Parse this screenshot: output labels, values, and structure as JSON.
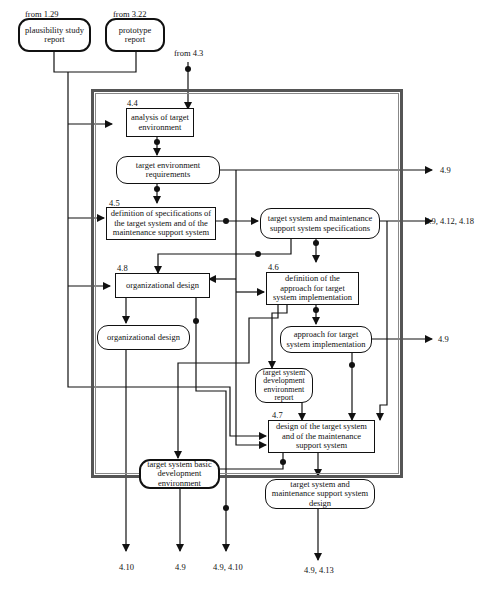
{
  "diagram": {
    "type": "process-flow",
    "frame_label": "",
    "external_inputs": {
      "plausibility": {
        "source": "from 1.29",
        "label": "plausibility study report"
      },
      "prototype": {
        "source": "from 3.22",
        "label": "prototype report"
      },
      "from43": {
        "source": "from 4.3"
      }
    },
    "processes": {
      "p44": {
        "id": "4.4",
        "label": "analysis of target environment"
      },
      "p45": {
        "id": "4.5",
        "label": "definition of specifications of the target system and of the maintenance support system"
      },
      "p48": {
        "id": "4.8",
        "label": "organizational design"
      },
      "p46": {
        "id": "4.6",
        "label": "definition of the approach for target system implementation"
      },
      "p47": {
        "id": "4.7",
        "label": "design of the target system and of the maintenance support system"
      }
    },
    "data_items": {
      "ter": {
        "label": "target environment requirements"
      },
      "tsms": {
        "label": "target system and maintenance support system specifications"
      },
      "od": {
        "label": "organizational design"
      },
      "atsi": {
        "label": "approach for target system implementation"
      },
      "tsder": {
        "label": "target system development environment report"
      },
      "tsbde": {
        "label": "target system basic development environment"
      },
      "tsmsd": {
        "label": "target system and maintenance support system design"
      }
    },
    "outputs": {
      "o_ter": "4.9",
      "o_tsms": "4.9, 4.12, 4.18",
      "o_atsi": "4.9",
      "o_od": "4.10",
      "o_tsbde": "4.9",
      "o_p48": "4.9, 4.10",
      "o_tsmsd": "4.9, 4.13"
    }
  }
}
